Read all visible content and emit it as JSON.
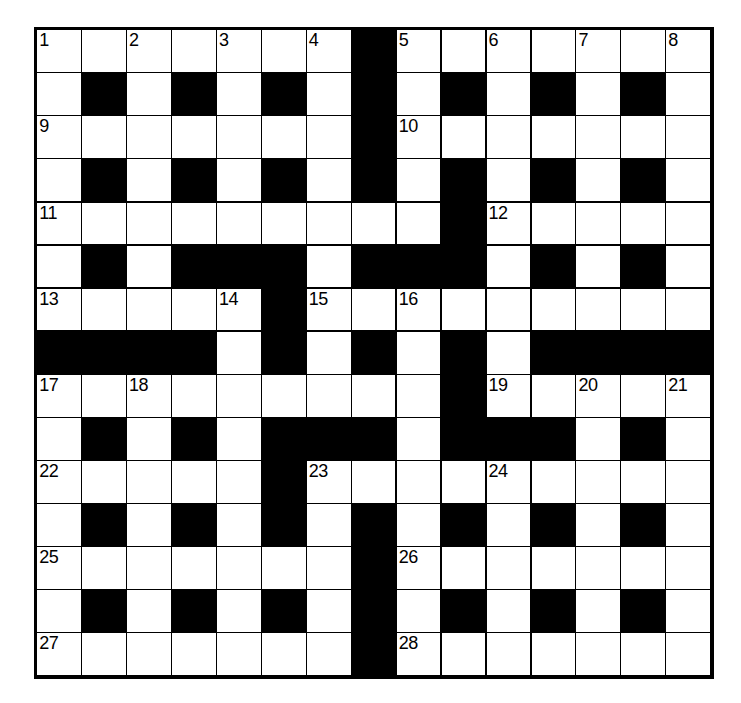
{
  "puzzle": {
    "title": "Crossword Grid",
    "size": {
      "rows": 15,
      "cols": 15
    },
    "colors": {
      "block": "#000000",
      "cell": "#ffffff",
      "border": "#000000",
      "number": "#000000"
    },
    "grid": [
      [
        "W",
        "W",
        "W",
        "W",
        "W",
        "W",
        "W",
        "B",
        "W",
        "W",
        "W",
        "W",
        "W",
        "W",
        "W"
      ],
      [
        "W",
        "B",
        "W",
        "B",
        "W",
        "B",
        "W",
        "B",
        "W",
        "B",
        "W",
        "B",
        "W",
        "B",
        "W"
      ],
      [
        "W",
        "W",
        "W",
        "W",
        "W",
        "W",
        "W",
        "B",
        "W",
        "W",
        "W",
        "W",
        "W",
        "W",
        "W"
      ],
      [
        "W",
        "B",
        "W",
        "B",
        "W",
        "B",
        "W",
        "B",
        "W",
        "B",
        "W",
        "B",
        "W",
        "B",
        "W"
      ],
      [
        "W",
        "W",
        "W",
        "W",
        "W",
        "W",
        "W",
        "W",
        "W",
        "B",
        "W",
        "W",
        "W",
        "W",
        "W"
      ],
      [
        "W",
        "B",
        "W",
        "B",
        "B",
        "B",
        "W",
        "B",
        "B",
        "B",
        "W",
        "B",
        "W",
        "B",
        "W"
      ],
      [
        "W",
        "W",
        "W",
        "W",
        "W",
        "B",
        "W",
        "W",
        "W",
        "W",
        "W",
        "W",
        "W",
        "W",
        "W"
      ],
      [
        "B",
        "B",
        "B",
        "B",
        "W",
        "B",
        "W",
        "B",
        "W",
        "B",
        "W",
        "B",
        "B",
        "B",
        "B"
      ],
      [
        "W",
        "W",
        "W",
        "W",
        "W",
        "W",
        "W",
        "W",
        "W",
        "B",
        "W",
        "W",
        "W",
        "W",
        "W"
      ],
      [
        "W",
        "B",
        "W",
        "B",
        "W",
        "B",
        "B",
        "B",
        "W",
        "B",
        "B",
        "B",
        "W",
        "B",
        "W"
      ],
      [
        "W",
        "W",
        "W",
        "W",
        "W",
        "B",
        "W",
        "W",
        "W",
        "W",
        "W",
        "W",
        "W",
        "W",
        "W"
      ],
      [
        "W",
        "B",
        "W",
        "B",
        "W",
        "B",
        "W",
        "B",
        "W",
        "B",
        "W",
        "B",
        "W",
        "B",
        "W"
      ],
      [
        "W",
        "W",
        "W",
        "W",
        "W",
        "W",
        "W",
        "B",
        "W",
        "W",
        "W",
        "W",
        "W",
        "W",
        "W"
      ],
      [
        "W",
        "B",
        "W",
        "B",
        "W",
        "B",
        "W",
        "B",
        "W",
        "B",
        "W",
        "B",
        "W",
        "B",
        "W"
      ],
      [
        "W",
        "W",
        "W",
        "W",
        "W",
        "W",
        "W",
        "B",
        "W",
        "W",
        "W",
        "W",
        "W",
        "W",
        "W"
      ]
    ],
    "numbers": [
      {
        "row": 1,
        "col": 1,
        "label": "1"
      },
      {
        "row": 1,
        "col": 3,
        "label": "2"
      },
      {
        "row": 1,
        "col": 5,
        "label": "3"
      },
      {
        "row": 1,
        "col": 7,
        "label": "4"
      },
      {
        "row": 1,
        "col": 9,
        "label": "5"
      },
      {
        "row": 1,
        "col": 11,
        "label": "6"
      },
      {
        "row": 1,
        "col": 13,
        "label": "7"
      },
      {
        "row": 1,
        "col": 15,
        "label": "8"
      },
      {
        "row": 3,
        "col": 1,
        "label": "9"
      },
      {
        "row": 3,
        "col": 9,
        "label": "10"
      },
      {
        "row": 5,
        "col": 1,
        "label": "11"
      },
      {
        "row": 5,
        "col": 11,
        "label": "12"
      },
      {
        "row": 7,
        "col": 1,
        "label": "13"
      },
      {
        "row": 7,
        "col": 5,
        "label": "14"
      },
      {
        "row": 7,
        "col": 7,
        "label": "15"
      },
      {
        "row": 7,
        "col": 9,
        "label": "16"
      },
      {
        "row": 9,
        "col": 1,
        "label": "17"
      },
      {
        "row": 9,
        "col": 3,
        "label": "18"
      },
      {
        "row": 9,
        "col": 11,
        "label": "19"
      },
      {
        "row": 9,
        "col": 13,
        "label": "20"
      },
      {
        "row": 9,
        "col": 15,
        "label": "21"
      },
      {
        "row": 11,
        "col": 1,
        "label": "22"
      },
      {
        "row": 11,
        "col": 7,
        "label": "23"
      },
      {
        "row": 11,
        "col": 11,
        "label": "24"
      },
      {
        "row": 13,
        "col": 1,
        "label": "25"
      },
      {
        "row": 13,
        "col": 9,
        "label": "26"
      },
      {
        "row": 15,
        "col": 1,
        "label": "27"
      },
      {
        "row": 15,
        "col": 9,
        "label": "28"
      }
    ],
    "letters": []
  }
}
